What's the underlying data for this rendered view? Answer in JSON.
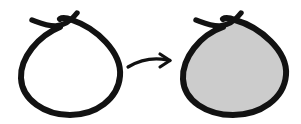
{
  "canvas": {
    "width": 301,
    "height": 124,
    "background_color": "#ffffff",
    "title": "unfilled-loop-to-filled-loop"
  },
  "palette": {
    "ink": "#111111",
    "stroke": "#121212",
    "fill_gray": "#cccccc",
    "paper": "#ffffff",
    "none": "none"
  },
  "figures": [
    {
      "id": "left-loop",
      "label": "unfilled hand drawn loop",
      "fill": "none",
      "stroke": "#121212",
      "stroke_width": 6,
      "bounds": {
        "x": 17,
        "y": 10,
        "width": 106,
        "height": 106
      },
      "loop_path": "M 60 27 C 38 36 20 58 21 78 C 22 100 45 115 70 115 C 96 115 118 99 120 76 C 122 52 96 28 72 20 C 67 18 63 17 60 19",
      "tail_path": "M 32 20 C 46 25 62 33 77 13"
    },
    {
      "id": "transform-arrow",
      "label": "transforms into",
      "stroke": "#121212",
      "stroke_width": 3.2,
      "bounds": {
        "x": 128,
        "y": 54,
        "width": 44,
        "height": 16
      },
      "shaft_path": "M 128 67 C 140 60 152 57 167 60",
      "head_upper_path": "M 160 54 L 170 60.5",
      "head_lower_path": "M 160 67 L 170 60.5"
    },
    {
      "id": "right-loop",
      "label": "gray filled hand drawn loop",
      "fill": "#cccccc",
      "stroke": "#121212",
      "stroke_width": 6,
      "bounds": {
        "x": 178,
        "y": 10,
        "width": 110,
        "height": 106
      },
      "loop_path": "M 223 27 C 200 35 182 58 183 79 C 184 101 207 115 233 115 C 260 115 284 99 286 75 C 288 51 260 27 235 20 C 230 18 226 17 223 19",
      "tail_path": "M 196 20 C 210 25 226 33 241 13"
    }
  ],
  "alt_text": "A hand drawn teardrop shaped loop with crossing tails at the top, an arrow pointing right, and the same loop filled with light gray."
}
